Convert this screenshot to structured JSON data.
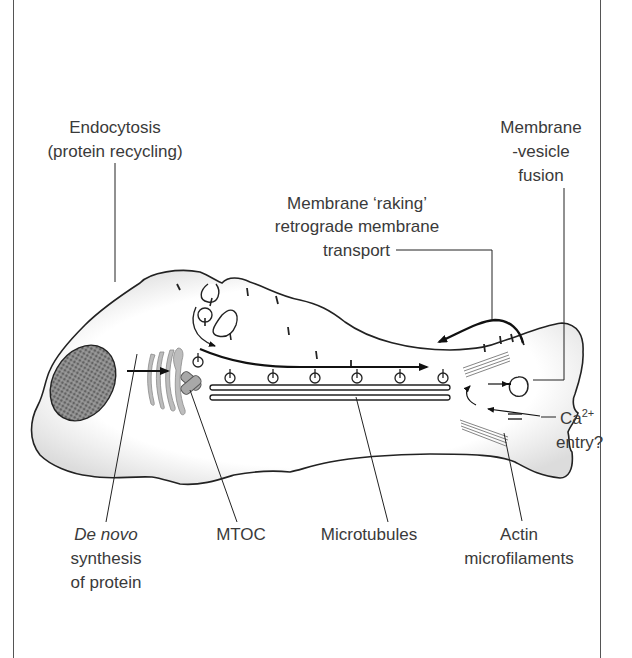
{
  "figure": {
    "colors": {
      "line": "#222222",
      "text": "#3a3a3a",
      "cell_fill": "#ffffff",
      "cell_shade": "#d9d9d9",
      "nucleus": "#555555",
      "golgi": "#b5b5b5",
      "mtoc": "#a8a8a8",
      "frame": "#555555"
    }
  },
  "labels": {
    "endocytosis": {
      "line1": "Endocytosis",
      "line2": "(protein recycling)"
    },
    "membrane_vesicle_fusion": {
      "line1": "Membrane",
      "line2": "-vesicle",
      "line3": "fusion"
    },
    "membrane_raking": {
      "line1": "Membrane ‘raking’",
      "line2": "retrograde membrane",
      "line3": "transport"
    },
    "calcium_entry": {
      "ion": "Ca",
      "superscript": "2+",
      "line2": "entry?"
    },
    "de_novo": {
      "line1": "De novo",
      "line2": "synthesis",
      "line3": "of protein"
    },
    "mtoc": "MTOC",
    "microtubules": "Microtubules",
    "actin": {
      "line1": "Actin",
      "line2": "microfilaments"
    }
  },
  "structures": {
    "vesicle_count_along_microtubules": 6,
    "golgi_cisternae": 4,
    "membrane_protein_markers": 12
  }
}
